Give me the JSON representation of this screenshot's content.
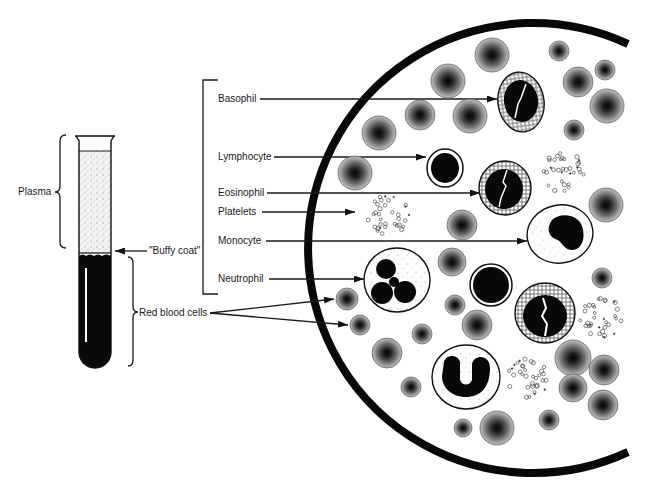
{
  "tube": {
    "plasma_label": "Plasma",
    "buffy_coat_label": "\"Buffy coat\"",
    "red_cells_label": "Red blood cells"
  },
  "cell_labels": {
    "basophil": "Basophil",
    "lymphocyte": "Lymphocyte",
    "eosinophil": "Eosinophil",
    "platelets": "Platelets",
    "monocyte": "Monocyte",
    "neutrophil": "Neutrophil"
  }
}
